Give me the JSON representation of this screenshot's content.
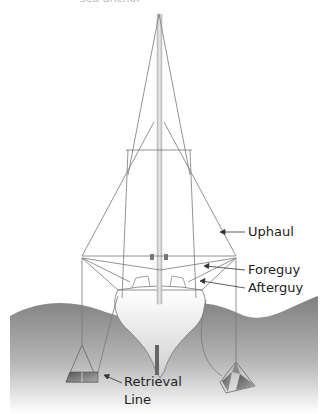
{
  "diagram": {
    "title_fragment": "sea anchor",
    "labels": {
      "uphaul": "Uphaul",
      "foreguy": "Foreguy",
      "afterguy": "Afterguy",
      "retrieval_line_1": "Retrieval",
      "retrieval_line_2": "Line"
    },
    "colors": {
      "line": "#666666",
      "mast": "#cfcfcf",
      "water_top": "#8a8a8a",
      "water_bottom": "#ffffff",
      "hull": "#f2f2f2",
      "text": "#222222"
    }
  }
}
